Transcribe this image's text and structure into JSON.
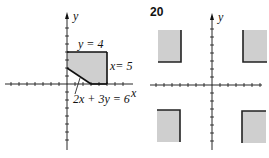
{
  "figures": [
    {
      "id": "left",
      "axis_labels": {
        "x": "x",
        "y": "y"
      },
      "lines": [
        {
          "label": "y = 4",
          "equation": "y = 4"
        },
        {
          "label": "x= 5",
          "equation": "x = 5"
        },
        {
          "label": "2x + 3y = 6",
          "equation": "2x + 3y = 6"
        }
      ],
      "region": {
        "description": "shaded feasible region",
        "vertices": [
          [
            0,
            4
          ],
          [
            5,
            4
          ],
          [
            5,
            0
          ],
          [
            3,
            0
          ],
          [
            0,
            2
          ]
        ],
        "fill": "#cfcfcf"
      }
    },
    {
      "id": "right",
      "number": "20",
      "axis_labels": {
        "y": "y"
      },
      "region": {
        "description": "four shaded rectangles, one per quadrant, with bold edges facing the origin axes",
        "fill": "#cfcfcf"
      }
    }
  ],
  "colors": {
    "ink": "#111111",
    "shade": "#cfcfcf"
  }
}
